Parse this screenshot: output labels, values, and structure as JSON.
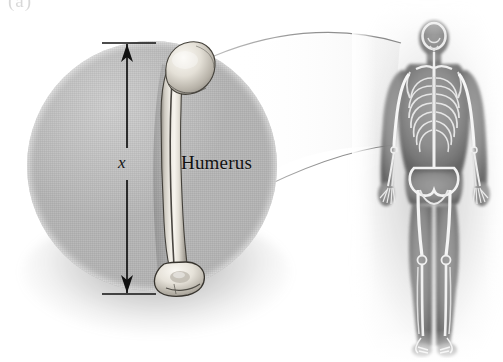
{
  "figure": {
    "label": "(a)",
    "caption_text": "",
    "background_color": "#ffffff"
  },
  "magnifier": {
    "name": "magnified-circle-callout",
    "fill_color": "#b4b4b4",
    "center_x": 152,
    "center_y": 166,
    "radius": 125
  },
  "bone": {
    "label": "Humerus",
    "label_color": "#111111",
    "fill_color": "#d8d4cc",
    "outline_color": "#3a3732"
  },
  "dimension": {
    "label": "x",
    "label_color": "#141414",
    "line_color": "#111111",
    "arrow_top_y": 43,
    "arrow_bottom_y": 288,
    "orientation": "vertical",
    "double_headed": true
  },
  "skeleton": {
    "name": "full-body-skeleton-xray",
    "view": "anterior",
    "bone_color": "#e9e9e9",
    "body_color": "#8c8c8c",
    "highlighted_bone": "Humerus"
  },
  "leader_lines": {
    "count": 2,
    "color": "#9a9a9a",
    "from": "magnified-circle-callout",
    "to": "skeleton-left-humerus"
  }
}
